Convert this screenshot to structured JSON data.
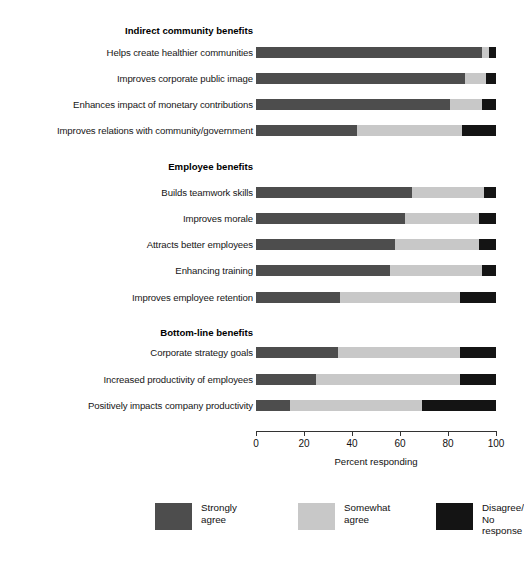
{
  "chart_data": {
    "type": "bar",
    "subtype": "stacked-horizontal-100pct",
    "title": "",
    "xlabel": "Percent responding",
    "ylabel": "",
    "xlim": [
      0,
      100
    ],
    "xticks": [
      0,
      20,
      40,
      60,
      80,
      100
    ],
    "grid": false,
    "legend_position": "bottom",
    "series": [
      {
        "name": "Strongly agree",
        "color": "#4d4d4d",
        "values": [
          94,
          87,
          81,
          42,
          65,
          62,
          58,
          56,
          35,
          34,
          25,
          14
        ]
      },
      {
        "name": "Somewhat agree",
        "color": "#c8c8c8",
        "values": [
          3,
          9,
          13,
          44,
          30,
          31,
          35,
          38,
          50,
          51,
          60,
          55
        ]
      },
      {
        "name": "Disagree/ No response",
        "color": "#141414",
        "values": [
          3,
          4,
          6,
          14,
          5,
          7,
          7,
          6,
          15,
          15,
          15,
          31
        ]
      }
    ],
    "categories": [
      "Helps create healthier communities",
      "Improves corporate public image",
      "Enhances impact of monetary contributions",
      "Improves relations with community/government",
      "Builds teamwork skills",
      "Improves morale",
      "Attracts better employees",
      "Enhancing training",
      "Improves employee retention",
      "Corporate strategy goals",
      "Increased productivity of employees",
      "Positively impacts company productivity"
    ],
    "groups": [
      {
        "header": "Indirect community benefits",
        "category_indices": [
          0,
          1,
          2,
          3
        ]
      },
      {
        "header": "Employee benefits",
        "category_indices": [
          4,
          5,
          6,
          7,
          8
        ]
      },
      {
        "header": "Bottom-line benefits",
        "category_indices": [
          9,
          10,
          11
        ]
      }
    ]
  },
  "top_clipped_text": "",
  "groups": [
    {
      "header": "Indirect community benefits",
      "header_y": 24,
      "rows": [
        {
          "label": "Helps create healthier communities",
          "y": 46,
          "strongly": 94,
          "somewhat": 3,
          "disagree": 3
        },
        {
          "label": "Improves corporate public image",
          "y": 72,
          "strongly": 87,
          "somewhat": 9,
          "disagree": 4
        },
        {
          "label": "Enhances impact of monetary contributions",
          "y": 98,
          "strongly": 81,
          "somewhat": 13,
          "disagree": 6
        },
        {
          "label": "Improves relations with community/government",
          "y": 124,
          "strongly": 42,
          "somewhat": 44,
          "disagree": 14
        }
      ]
    },
    {
      "header": "Employee benefits",
      "header_y": 160,
      "rows": [
        {
          "label": "Builds teamwork skills",
          "y": 186,
          "strongly": 65,
          "somewhat": 30,
          "disagree": 5
        },
        {
          "label": "Improves morale",
          "y": 212,
          "strongly": 62,
          "somewhat": 31,
          "disagree": 7
        },
        {
          "label": "Attracts better employees",
          "y": 238,
          "strongly": 58,
          "somewhat": 35,
          "disagree": 7
        },
        {
          "label": "Enhancing training",
          "y": 264,
          "strongly": 56,
          "somewhat": 38,
          "disagree": 6
        },
        {
          "label": "Improves employee retention",
          "y": 291,
          "strongly": 35,
          "somewhat": 50,
          "disagree": 15
        }
      ]
    },
    {
      "header": "Bottom-line benefits",
      "header_y": 326,
      "rows": [
        {
          "label": "Corporate strategy goals",
          "y": 346,
          "strongly": 34,
          "somewhat": 51,
          "disagree": 15
        },
        {
          "label": "Increased productivity of employees",
          "y": 373,
          "strongly": 25,
          "somewhat": 60,
          "disagree": 15
        },
        {
          "label": "Positively impacts company productivity",
          "y": 399,
          "strongly": 14,
          "somewhat": 55,
          "disagree": 31
        }
      ]
    }
  ],
  "axis": {
    "ticks": [
      {
        "value": 0,
        "label": "0"
      },
      {
        "value": 20,
        "label": "20"
      },
      {
        "value": 40,
        "label": "40"
      },
      {
        "value": 60,
        "label": "60"
      },
      {
        "value": 80,
        "label": "80"
      },
      {
        "value": 100,
        "label": "100"
      }
    ],
    "title": "Percent responding"
  },
  "legend": {
    "items": [
      {
        "label": "Strongly\nagree",
        "color": "#4d4d4d",
        "x": 0
      },
      {
        "label": "Somewhat\nagree",
        "color": "#c8c8c8",
        "x": 143
      },
      {
        "label": "Disagree/\nNo response",
        "color": "#141414",
        "x": 281
      }
    ]
  },
  "colors": {
    "strongly": "#4d4d4d",
    "somewhat": "#c8c8c8",
    "disagree": "#141414",
    "axis": "#333333",
    "text": "#111111",
    "background": "#ffffff"
  }
}
